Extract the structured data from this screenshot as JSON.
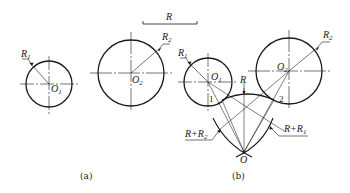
{
  "diagram": {
    "type": "geometric-construction",
    "scale_bar": {
      "label": "R"
    },
    "panel_a": {
      "caption": "(a)",
      "circles": [
        {
          "center_label": "O",
          "center_sub": "1",
          "radius_label": "R",
          "radius_sub": "1"
        },
        {
          "center_label": "O",
          "center_sub": "2",
          "radius_label": "R",
          "radius_sub": "2"
        }
      ]
    },
    "panel_b": {
      "caption": "(b)",
      "circles": [
        {
          "center_label": "O",
          "center_sub": "1",
          "radius_label": "R",
          "radius_sub": "1"
        },
        {
          "center_label": "O",
          "center_sub": "2",
          "radius_label": "R",
          "radius_sub": "2"
        }
      ],
      "arc_radius_label": "R",
      "construction_arcs": [
        {
          "label": "R+R",
          "sub": "2"
        },
        {
          "label": "R+R",
          "sub": "1"
        }
      ],
      "tangent_points": [
        "1",
        "2"
      ],
      "arc_center_label": "O"
    }
  },
  "colors": {
    "stroke": "#1a1a1a",
    "background": "#ffffff"
  }
}
